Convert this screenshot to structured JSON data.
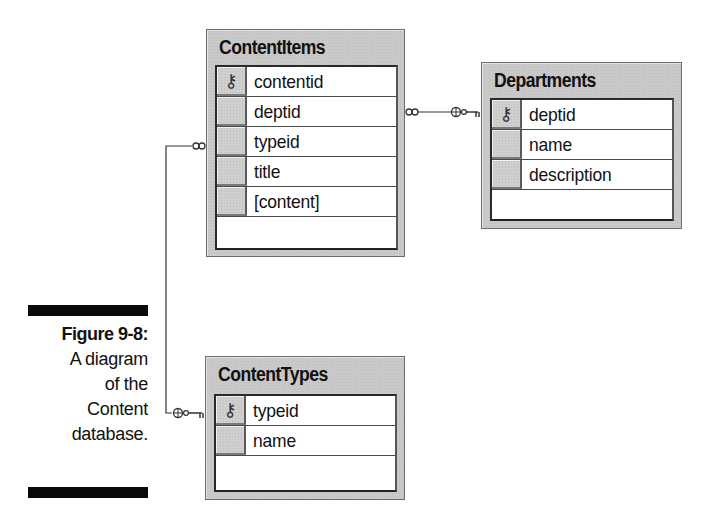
{
  "diagram": {
    "tables": [
      {
        "id": "contentitems",
        "name": "ContentItems",
        "fields": [
          {
            "name": "contentid",
            "primary_key": true,
            "icon": "key-icon"
          },
          {
            "name": "deptid",
            "primary_key": false
          },
          {
            "name": "typeid",
            "primary_key": false
          },
          {
            "name": "title",
            "primary_key": false
          },
          {
            "name": "[content]",
            "primary_key": false
          }
        ]
      },
      {
        "id": "departments",
        "name": "Departments",
        "fields": [
          {
            "name": "deptid",
            "primary_key": true,
            "icon": "key-icon"
          },
          {
            "name": "name",
            "primary_key": false
          },
          {
            "name": "description",
            "primary_key": false
          }
        ]
      },
      {
        "id": "contenttypes",
        "name": "ContentTypes",
        "fields": [
          {
            "name": "typeid",
            "primary_key": true,
            "icon": "key-icon"
          },
          {
            "name": "name",
            "primary_key": false
          }
        ]
      }
    ],
    "relationships": [
      {
        "from": "ContentItems",
        "from_end": "many (infinity)",
        "to": "Departments",
        "to_end": "one (key)"
      },
      {
        "from": "ContentItems",
        "from_end": "many (infinity)",
        "to": "ContentTypes",
        "to_end": "one (key)"
      }
    ]
  },
  "caption": {
    "label": "Figure 9-8:",
    "lines": [
      "A diagram",
      "of the",
      "Content",
      "database."
    ]
  },
  "colors": {
    "table_frame": "#c9c9c9",
    "panel_bg": "#ffffff",
    "caption_bar": "#0a0a0a",
    "line": "#333333"
  }
}
